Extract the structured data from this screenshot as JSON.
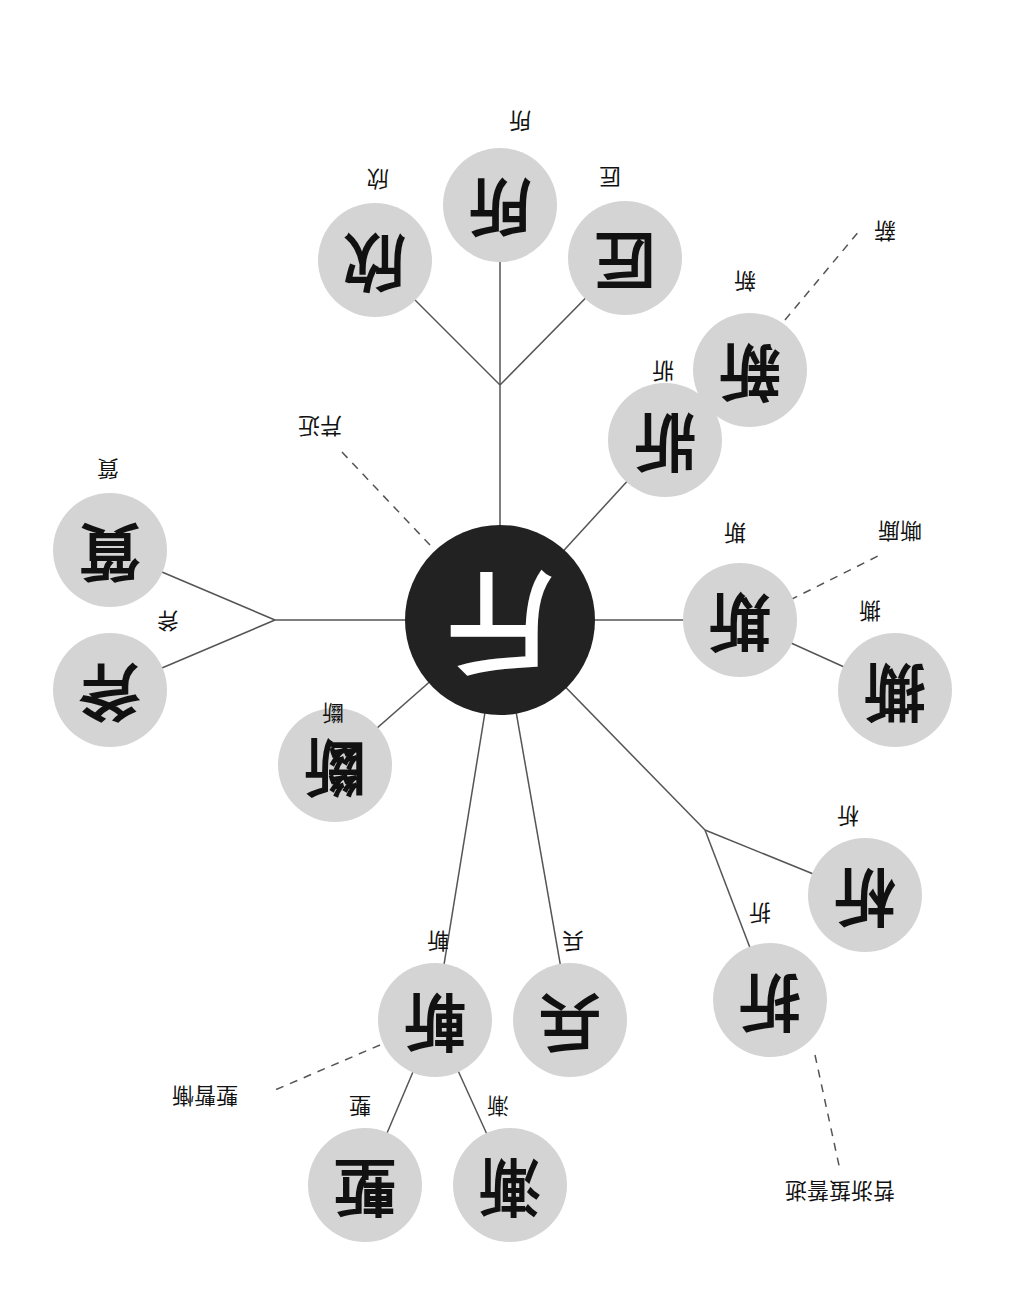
{
  "diagram": {
    "orientation": "rotated-180",
    "center": {
      "id": "jin",
      "char": "斤",
      "x": 500,
      "y": 620,
      "r": 95
    },
    "nodes": [
      {
        "id": "xin_joy",
        "char": "欣",
        "label": "欣",
        "x": 375,
        "y": 260,
        "r": 57,
        "lx": 378,
        "ly": 178
      },
      {
        "id": "suo",
        "char": "所",
        "label": "所",
        "x": 500,
        "y": 205,
        "r": 57,
        "lx": 520,
        "ly": 120
      },
      {
        "id": "jiang",
        "char": "匠",
        "label": "匠",
        "x": 625,
        "y": 258,
        "r": 57,
        "lx": 610,
        "ly": 176
      },
      {
        "id": "xin_new",
        "char": "新",
        "label": "新",
        "x": 750,
        "y": 370,
        "r": 57,
        "lx": 745,
        "ly": 280
      },
      {
        "id": "qiang",
        "char": "斨",
        "label": "斨",
        "x": 665,
        "y": 440,
        "r": 57,
        "lx": 663,
        "ly": 370
      },
      {
        "id": "si",
        "char": "斯",
        "label": "斯",
        "x": 740,
        "y": 620,
        "r": 57,
        "lx": 735,
        "ly": 532
      },
      {
        "id": "si_tear",
        "char": "撕",
        "label": "撕",
        "x": 895,
        "y": 690,
        "r": 57,
        "lx": 870,
        "ly": 610
      },
      {
        "id": "xi",
        "char": "析",
        "label": "析",
        "x": 865,
        "y": 895,
        "r": 57,
        "lx": 848,
        "ly": 815
      },
      {
        "id": "zhe",
        "char": "折",
        "label": "折",
        "x": 770,
        "y": 1000,
        "r": 57,
        "lx": 760,
        "ly": 912
      },
      {
        "id": "bing",
        "char": "兵",
        "label": "兵",
        "x": 570,
        "y": 1020,
        "r": 57,
        "lx": 573,
        "ly": 940
      },
      {
        "id": "zhan",
        "char": "斬",
        "label": "斬",
        "x": 435,
        "y": 1020,
        "r": 57,
        "lx": 438,
        "ly": 940
      },
      {
        "id": "jian",
        "char": "漸",
        "label": "漸",
        "x": 510,
        "y": 1185,
        "r": 57,
        "lx": 498,
        "ly": 1105
      },
      {
        "id": "qian",
        "char": "塹",
        "label": "塹",
        "x": 365,
        "y": 1185,
        "r": 57,
        "lx": 360,
        "ly": 1105
      },
      {
        "id": "duan",
        "char": "斷",
        "label": "斷",
        "x": 335,
        "y": 765,
        "r": 57,
        "lx": 333,
        "ly": 712
      },
      {
        "id": "fu",
        "char": "斧",
        "label": "斧",
        "x": 110,
        "y": 690,
        "r": 57,
        "lx": 168,
        "ly": 620
      },
      {
        "id": "zhi",
        "char": "質",
        "label": "質",
        "x": 110,
        "y": 550,
        "r": 57,
        "lx": 108,
        "ly": 468
      }
    ],
    "edges": [
      [
        "center",
        "junction_top"
      ],
      [
        "junction_top",
        "xin_joy"
      ],
      [
        "junction_top",
        "suo"
      ],
      [
        "junction_top",
        "jiang"
      ],
      [
        "center",
        "qiang"
      ],
      [
        "center",
        "si"
      ],
      [
        "si",
        "si_tear"
      ],
      [
        "center",
        "junction_right"
      ],
      [
        "junction_right",
        "xi"
      ],
      [
        "junction_right",
        "zhe"
      ],
      [
        "center",
        "bing"
      ],
      [
        "center",
        "zhan"
      ],
      [
        "zhan",
        "jian"
      ],
      [
        "zhan",
        "qian"
      ],
      [
        "center",
        "duan"
      ],
      [
        "center",
        "junction_left"
      ],
      [
        "junction_left",
        "fu"
      ],
      [
        "junction_left",
        "zhi"
      ]
    ],
    "junctions": {
      "junction_top": {
        "x": 500,
        "y": 385
      },
      "junction_right": {
        "x": 705,
        "y": 830
      },
      "junction_left": {
        "x": 275,
        "y": 620
      }
    },
    "dashed_annotations": [
      {
        "from": "xin_new",
        "text": "薪",
        "x1": 785,
        "y1": 320,
        "x2": 860,
        "y2": 230,
        "lx": 885,
        "ly": 230
      },
      {
        "from": "si",
        "text": "嘶廝",
        "x1": 790,
        "y1": 600,
        "x2": 880,
        "y2": 555,
        "lx": 900,
        "ly": 530
      },
      {
        "from": "zhe",
        "text": "哲浙蜇誓逝",
        "x1": 815,
        "y1": 1055,
        "x2": 840,
        "y2": 1170,
        "lx": 840,
        "ly": 1190
      },
      {
        "from": "zhan",
        "text": "塹暫慚",
        "x1": 380,
        "y1": 1045,
        "x2": 275,
        "y2": 1090,
        "lx": 205,
        "ly": 1095
      },
      {
        "from": "center",
        "text": "芹近",
        "x1": 430,
        "y1": 545,
        "x2": 340,
        "y2": 450,
        "lx": 320,
        "ly": 425
      }
    ],
    "colors": {
      "node_fill": "#d4d4d4",
      "center_fill": "#222222",
      "line": "#555555",
      "text": "#111111"
    }
  }
}
